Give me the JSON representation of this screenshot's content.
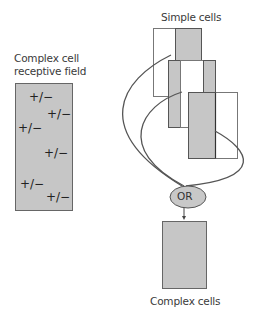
{
  "labels": {
    "receptive_field_line1": "Complex cell",
    "receptive_field_line2": "receptive field",
    "simple_cells": "Simple cells",
    "or_gate": "OR",
    "complex_cells": "Complex cells"
  },
  "receptive_field": {
    "symbols": [
      "+/−",
      "+/−",
      "+/−",
      "+/−",
      "+/−",
      "+/−"
    ]
  },
  "colors": {
    "fill_gray": "#c6c6c6",
    "stroke": "#555555",
    "or_fill": "#c8c8c8",
    "curve": "#555555"
  }
}
